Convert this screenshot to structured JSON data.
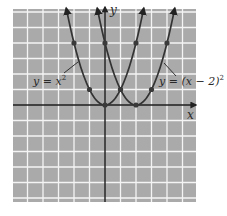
{
  "chart_data": {
    "type": "line",
    "title": "",
    "xlabel": "x",
    "ylabel": "y",
    "xlim": [
      -6,
      6
    ],
    "ylim": [
      -6.2,
      6.2
    ],
    "grid": true,
    "tick_labels_shown": false,
    "series": [
      {
        "name": "y = x^2",
        "label": "y = x",
        "label_sup": "2",
        "points": [
          [
            -2,
            4
          ],
          [
            -1,
            1
          ],
          [
            0,
            0
          ],
          [
            1,
            1
          ],
          [
            2,
            4
          ]
        ],
        "x_range": [
          -2.5,
          2.5
        ]
      },
      {
        "name": "y = (x − 2)^2",
        "label": "y = (x − 2)",
        "label_sup": "2",
        "points": [
          [
            0,
            4
          ],
          [
            1,
            1
          ],
          [
            2,
            0
          ],
          [
            3,
            1
          ],
          [
            4,
            4
          ]
        ],
        "x_range": [
          -0.5,
          4.5
        ]
      }
    ],
    "annotations": [
      {
        "text": "y = x^2",
        "points_to": [
          -1.6,
          2.6
        ]
      },
      {
        "text": "y = (x − 2)^2",
        "points_to": [
          3.6,
          2.6
        ]
      }
    ]
  },
  "colors": {
    "background": "#ffffff",
    "grid_fill": "#aaaaaa",
    "grid_lines": "#f4f4f4",
    "axes": "#1e1e1e",
    "curves": "#333333",
    "points": "#3a3a3a"
  },
  "labels": {
    "x_axis": "x",
    "y_axis": "y",
    "curve1": "y = x",
    "curve1_sup": "2",
    "curve2": "y = (x − 2)",
    "curve2_sup": "2"
  }
}
